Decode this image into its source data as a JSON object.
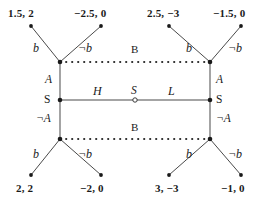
{
  "diagram": {
    "type": "extensive-form-game-tree",
    "title": "",
    "colors": {
      "background": "#ffffff",
      "line": "#4a4a4a",
      "node_fill": "#1a1a1a",
      "chance_node_fill": "#ffffff",
      "text": "#1a1a1a"
    }
  },
  "payoffs": {
    "top_left_1": "1.5, 2",
    "top_left_2": "−2.5, 0",
    "top_right_1": "2.5, −3",
    "top_right_2": "−1.5, 0",
    "bottom_left_1": "2, 2",
    "bottom_left_2": "−2, 0",
    "bottom_right_1": "3, −3",
    "bottom_right_2": "−1, 0"
  },
  "actions": {
    "top_left_b": "b",
    "top_left_nb": "¬b",
    "top_right_b": "b",
    "top_right_nb": "¬b",
    "bottom_left_b": "b",
    "bottom_left_nb": "¬b",
    "bottom_right_b": "b",
    "bottom_right_nb": "¬b",
    "left_up_A": "A",
    "left_down_notA": "¬A",
    "right_up_A": "A",
    "right_down_notA": "¬A",
    "chance_left_H": "H",
    "chance_right_L": "L"
  },
  "players": {
    "left_decision_node": "S",
    "right_decision_node": "S",
    "chance_node": "S",
    "infoset_top": "B",
    "infoset_bottom": "B"
  }
}
